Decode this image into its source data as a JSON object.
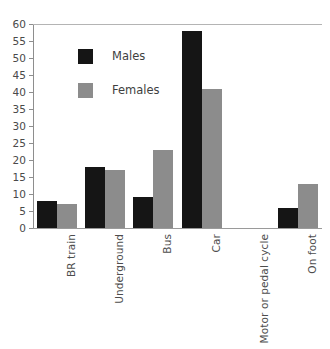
{
  "chart_data": {
    "type": "bar",
    "title": "",
    "subtitle": "",
    "xlabel": "",
    "ylabel": "",
    "categories": [
      "BR train",
      "Underground",
      "Bus",
      "Car",
      "Motor or pedal cycle",
      "On foot"
    ],
    "series": [
      {
        "name": "Males",
        "color": "#151515",
        "values": [
          8,
          18,
          9,
          58,
          0,
          6
        ]
      },
      {
        "name": "Females",
        "color": "#8c8c8c",
        "values": [
          7,
          17,
          23,
          41,
          0,
          13
        ]
      }
    ],
    "ylim": [
      0,
      60
    ],
    "ytick_step": 5,
    "yticks": [
      "0",
      "5",
      "10",
      "15",
      "20",
      "25",
      "30",
      "35",
      "40",
      "45",
      "50",
      "55",
      "60"
    ],
    "grid": false,
    "top_rule": true,
    "legend_position": "inside-upper-left",
    "legend": [
      "Males",
      "Females"
    ],
    "xtick_rotation": -90
  },
  "legend": {
    "items": [
      {
        "label": "Males",
        "swatch": "male-swatch"
      },
      {
        "label": "Females",
        "swatch": "female-swatch"
      }
    ]
  }
}
